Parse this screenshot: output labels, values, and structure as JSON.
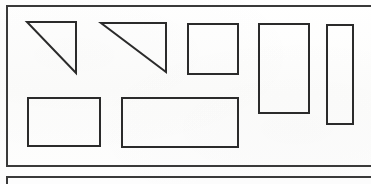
{
  "document": {
    "kind": "scanned-geometry-figure",
    "page_background": "#fdfdfc",
    "ink_color": "#2b2b2b",
    "width": 371,
    "height": 184
  },
  "panels": [
    {
      "id": "panel-upper",
      "name": "upper-figure-panel",
      "border_color": "#3a3a3a",
      "border_width": 2,
      "x": 6,
      "y": 5,
      "width": 368,
      "height": 162,
      "right_edge_clipped": true
    },
    {
      "id": "panel-lower",
      "name": "lower-figure-panel",
      "border_color": "#3a3a3a",
      "border_width": 2,
      "x": 6,
      "y": 176,
      "width": 368,
      "height": 20,
      "right_edge_clipped": true,
      "bottom_edge_clipped": true
    }
  ],
  "shapes": [
    {
      "id": "shape-1",
      "name": "right-triangle-small",
      "type": "triangle",
      "label": "Right triangle, right angle top-right",
      "stroke": "#2b2b2b",
      "stroke_width": 2,
      "points": "27,22 76,22 76,73",
      "bbox": {
        "x": 27,
        "y": 22,
        "width": 49,
        "height": 51
      }
    },
    {
      "id": "shape-2",
      "name": "right-triangle-wide",
      "type": "triangle",
      "label": "Right triangle, right angle top-right, wider base",
      "stroke": "#2b2b2b",
      "stroke_width": 2,
      "points": "101,23 166,23 166,72",
      "bbox": {
        "x": 101,
        "y": 23,
        "width": 65,
        "height": 49
      }
    },
    {
      "id": "shape-3",
      "name": "square-medium",
      "type": "rectangle",
      "label": "Square",
      "stroke": "#2b2b2b",
      "stroke_width": 2,
      "bbox": {
        "x": 188,
        "y": 24,
        "width": 50,
        "height": 50
      }
    },
    {
      "id": "shape-4",
      "name": "rectangle-tall-portrait",
      "type": "rectangle",
      "label": "Tall portrait rectangle",
      "stroke": "#2b2b2b",
      "stroke_width": 2,
      "bbox": {
        "x": 259,
        "y": 24,
        "width": 50,
        "height": 89
      }
    },
    {
      "id": "shape-5",
      "name": "rectangle-narrow-strip",
      "type": "rectangle",
      "label": "Narrow vertical strip rectangle",
      "stroke": "#2b2b2b",
      "stroke_width": 2,
      "bbox": {
        "x": 327,
        "y": 25,
        "width": 26,
        "height": 99
      }
    },
    {
      "id": "shape-6",
      "name": "rectangle-landscape-small",
      "type": "rectangle",
      "label": "Small landscape rectangle",
      "stroke": "#2b2b2b",
      "stroke_width": 2,
      "bbox": {
        "x": 28,
        "y": 98,
        "width": 72,
        "height": 48
      }
    },
    {
      "id": "shape-7",
      "name": "rectangle-landscape-wide",
      "type": "rectangle",
      "label": "Wide landscape rectangle",
      "stroke": "#2b2b2b",
      "stroke_width": 2,
      "bbox": {
        "x": 122,
        "y": 98,
        "width": 116,
        "height": 49
      }
    }
  ],
  "accessibility": {
    "figure_caption": "Seven outlined geometric shapes: two right triangles, a square, a tall rectangle, a narrow vertical strip, and two landscape rectangles, enclosed in a rectangular border."
  }
}
